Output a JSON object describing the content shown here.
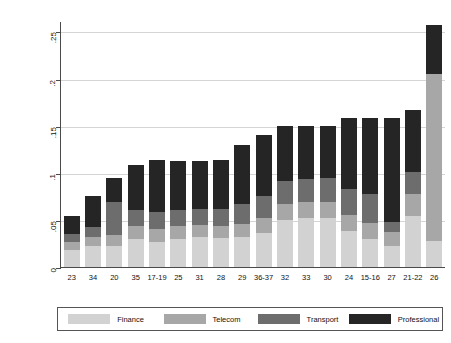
{
  "chart_data": {
    "type": "bar",
    "subtype": "stacked-bar",
    "title": "",
    "xlabel": "",
    "ylabel": "Services input intensity in manufacturing",
    "ylim": [
      0,
      0.26
    ],
    "ytick_values": [
      0,
      0.05,
      0.1,
      0.15,
      0.2,
      0.25
    ],
    "ytick_labels": [
      "0",
      ".05",
      ".1",
      ".15",
      ".2",
      ".25"
    ],
    "grid": "horizontal",
    "legend_position": "bottom",
    "categories": [
      "23",
      "34",
      "20",
      "35",
      "17-19",
      "25",
      "31",
      "28",
      "29",
      "36-37",
      "32",
      "33",
      "30",
      "24",
      "15-16",
      "27",
      "21-22",
      "26"
    ],
    "series": [
      {
        "name": "Finance",
        "color": "#d2d2d2",
        "values": [
          0.018,
          0.022,
          0.022,
          0.03,
          0.027,
          0.03,
          0.032,
          0.031,
          0.032,
          0.036,
          0.05,
          0.052,
          0.052,
          0.038,
          0.03,
          0.022,
          0.054,
          0.028
        ]
      },
      {
        "name": "Telecom",
        "color": "#a7a7a7",
        "values": [
          0.009,
          0.01,
          0.012,
          0.013,
          0.013,
          0.013,
          0.013,
          0.013,
          0.014,
          0.016,
          0.017,
          0.017,
          0.017,
          0.017,
          0.017,
          0.015,
          0.023,
          0.177
        ]
      },
      {
        "name": "Transport",
        "color": "#6d6d6d",
        "values": [
          0.008,
          0.011,
          0.035,
          0.017,
          0.018,
          0.018,
          0.017,
          0.018,
          0.021,
          0.023,
          0.024,
          0.024,
          0.025,
          0.028,
          0.03,
          0.011,
          0.024,
          0.0
        ]
      },
      {
        "name": "Professional",
        "color": "#252525",
        "values": [
          0.019,
          0.032,
          0.025,
          0.048,
          0.056,
          0.051,
          0.05,
          0.052,
          0.062,
          0.065,
          0.059,
          0.057,
          0.056,
          0.075,
          0.081,
          0.11,
          0.066,
          0.052
        ]
      }
    ],
    "totals": [
      0.054,
      0.075,
      0.094,
      0.108,
      0.114,
      0.112,
      0.112,
      0.114,
      0.129,
      0.14,
      0.15,
      0.15,
      0.15,
      0.158,
      0.158,
      0.158,
      0.167,
      0.257
    ]
  },
  "legend": {
    "items": [
      {
        "label": "Finance"
      },
      {
        "label": "Telecom"
      },
      {
        "label": "Transport"
      },
      {
        "label": "Professional"
      }
    ]
  }
}
